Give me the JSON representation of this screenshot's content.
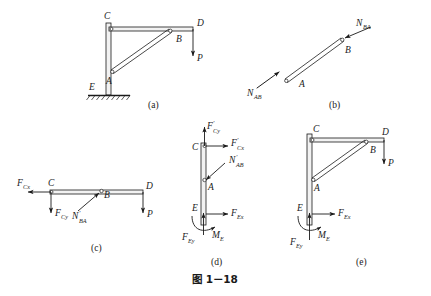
{
  "figure": {
    "caption": "图 1－18",
    "panels": [
      {
        "key": "a",
        "label": "(a)",
        "description": "Bracket frame: vertical post CE fixed at ground E, horizontal beam CD, diagonal strut AB, load P at D",
        "points": [
          "C",
          "B",
          "D",
          "A",
          "E"
        ],
        "point_labels": {
          "C": "C",
          "B": "B",
          "D": "D",
          "A": "A",
          "E": "E"
        },
        "forces": [
          {
            "name": "P",
            "label": "P",
            "direction": "down",
            "at": "D"
          }
        ]
      },
      {
        "key": "b",
        "label": "(b)",
        "description": "Free body of two-force member AB with axial tensile forces at both ends",
        "points": [
          "A",
          "B"
        ],
        "point_labels": {
          "A": "A",
          "B": "B"
        },
        "forces": [
          {
            "name": "N_AB",
            "base": "N",
            "sub": "AB",
            "prime": false,
            "direction": "down-left",
            "at": "A"
          },
          {
            "name": "N_BA",
            "base": "N",
            "sub": "BA",
            "prime": false,
            "direction": "up-right",
            "at": "B"
          }
        ]
      },
      {
        "key": "c",
        "label": "(c)",
        "description": "Free body of horizontal beam CD with pin reactions at C, strut reaction at B, load P at D",
        "points": [
          "C",
          "B",
          "D"
        ],
        "point_labels": {
          "C": "C",
          "B": "B",
          "D": "D"
        },
        "forces": [
          {
            "name": "F_Cx",
            "base": "F",
            "sub": "Cx",
            "prime": false,
            "direction": "left",
            "at": "C"
          },
          {
            "name": "F_Cy",
            "base": "F",
            "sub": "Cy",
            "prime": false,
            "direction": "down",
            "at": "C"
          },
          {
            "name": "N'_BA",
            "base": "N",
            "sub": "BA",
            "prime": true,
            "direction": "up-right",
            "at": "B"
          },
          {
            "name": "P",
            "base": "P",
            "sub": "",
            "prime": false,
            "direction": "down",
            "at": "D"
          }
        ]
      },
      {
        "key": "d",
        "label": "(d)",
        "description": "Free body of vertical post CE with reactions at C, strut reaction at A, fixed support reactions at E",
        "points": [
          "C",
          "A",
          "E"
        ],
        "point_labels": {
          "C": "C",
          "A": "A",
          "E": "E"
        },
        "forces": [
          {
            "name": "F'_Cy",
            "base": "F",
            "sub": "Cy",
            "prime": true,
            "direction": "up",
            "at": "C"
          },
          {
            "name": "F'_Cx",
            "base": "F",
            "sub": "Cx",
            "prime": true,
            "direction": "right",
            "at": "C"
          },
          {
            "name": "N'_AB",
            "base": "N",
            "sub": "AB",
            "prime": true,
            "direction": "down-left",
            "at": "A"
          },
          {
            "name": "F_Ex",
            "base": "F",
            "sub": "Ex",
            "prime": false,
            "direction": "right",
            "at": "E"
          },
          {
            "name": "F_Ey",
            "base": "F",
            "sub": "Ey",
            "prime": false,
            "direction": "up",
            "at": "E"
          },
          {
            "name": "M_E",
            "base": "M",
            "sub": "E",
            "prime": false,
            "direction": "moment-ccw",
            "at": "E"
          }
        ]
      },
      {
        "key": "e",
        "label": "(e)",
        "description": "Free body of the whole frame with load P at D and fixed support reactions at E",
        "points": [
          "C",
          "B",
          "D",
          "A",
          "E"
        ],
        "point_labels": {
          "C": "C",
          "B": "B",
          "D": "D",
          "A": "A",
          "E": "E"
        },
        "forces": [
          {
            "name": "P",
            "base": "P",
            "sub": "",
            "prime": false,
            "direction": "down",
            "at": "D"
          },
          {
            "name": "F_Ex",
            "base": "F",
            "sub": "Ex",
            "prime": false,
            "direction": "right",
            "at": "E"
          },
          {
            "name": "F_Ey",
            "base": "F",
            "sub": "Ey",
            "prime": false,
            "direction": "up",
            "at": "E"
          },
          {
            "name": "M_E",
            "base": "M",
            "sub": "E",
            "prime": false,
            "direction": "moment-ccw",
            "at": "E"
          }
        ]
      }
    ]
  },
  "colors": {
    "ink": "#1a1a1a",
    "bar_fill": "#f2f2f2",
    "background": "#ffffff"
  }
}
